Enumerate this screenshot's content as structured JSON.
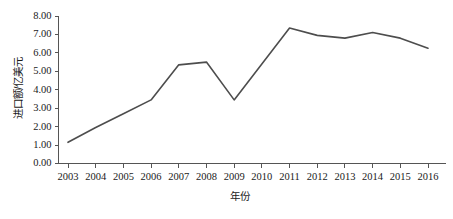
{
  "chart_data": {
    "type": "line",
    "title": "",
    "xlabel": "年份",
    "ylabel": "进口额/亿美元",
    "categories": [
      "2003",
      "2004",
      "2005",
      "2006",
      "2007",
      "2008",
      "2009",
      "2010",
      "2011",
      "2012",
      "2013",
      "2014",
      "2015",
      "2016"
    ],
    "values": [
      1.15,
      1.95,
      2.7,
      3.45,
      5.35,
      5.5,
      3.45,
      5.4,
      7.35,
      6.95,
      6.8,
      7.1,
      6.8,
      6.25
    ],
    "series": [
      {
        "name": "进口额",
        "values": [
          1.15,
          1.95,
          2.7,
          3.45,
          5.35,
          5.5,
          3.45,
          5.4,
          7.35,
          6.95,
          6.8,
          7.1,
          6.8,
          6.25
        ]
      }
    ],
    "ylim": [
      0.0,
      8.0
    ],
    "ytick_labels": [
      "0.00",
      "1.00",
      "2.00",
      "3.00",
      "4.00",
      "5.00",
      "6.00",
      "7.00",
      "8.00"
    ],
    "ytick_values": [
      0,
      1,
      2,
      3,
      4,
      5,
      6,
      7,
      8
    ],
    "grid": false,
    "legend": false,
    "legend_position": "none",
    "line_color": "#4d4d4d",
    "axis_color": "#555555"
  }
}
